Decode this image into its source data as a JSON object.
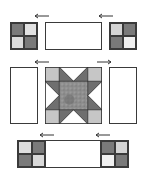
{
  "colors": {
    "dark": "#7a7a7a",
    "light": "#dedede",
    "white": "#f4f4f4",
    "corner": "#c6c6c6",
    "star_point": "#6f6f6f",
    "center": "#8c8c8c",
    "outline": "#3a3a3a"
  },
  "diagram": {
    "rows": [
      {
        "units": [
          "four-patch (dark/light, light/dark)",
          "plain rectangle",
          "four-patch (light/dark, dark/white)"
        ],
        "arrows": [
          "left",
          "left"
        ]
      },
      {
        "units": [
          "plain rectangle",
          "sawtooth star block",
          "plain rectangle"
        ],
        "arrows": [
          "left",
          "right"
        ]
      },
      {
        "units": [
          "four-patch strip (light/dark, dark/light)",
          "plain rectangle",
          "four-patch strip (dark/light, white/dark)"
        ],
        "arrows": [
          "left",
          "left"
        ]
      }
    ]
  }
}
